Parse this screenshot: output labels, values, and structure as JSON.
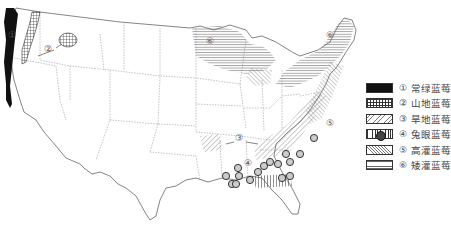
{
  "figure": {
    "type": "distribution-map",
    "region": "United States",
    "map_labels": [
      "①",
      "②",
      "③",
      "④",
      "⑤",
      "⑥"
    ]
  },
  "legend": {
    "items": [
      {
        "num": "①",
        "label": "常绿蓝莓",
        "pattern": "solid-black"
      },
      {
        "num": "②",
        "label": "山地蓝莓",
        "pattern": "grid"
      },
      {
        "num": "③",
        "label": "旱地蓝莓",
        "pattern": "diagonal-forward"
      },
      {
        "num": "④",
        "label": "兔眼蓝莓",
        "pattern": "circle-symbol-vertical-lines"
      },
      {
        "num": "⑤",
        "label": "高灌蓝莓",
        "pattern": "diagonal-backward"
      },
      {
        "num": "⑥",
        "label": "矮灌蓝莓",
        "pattern": "horizontal-lines"
      }
    ]
  },
  "colors": {
    "line": "#555555",
    "fill_dark": "#111111",
    "text": "#444444"
  }
}
